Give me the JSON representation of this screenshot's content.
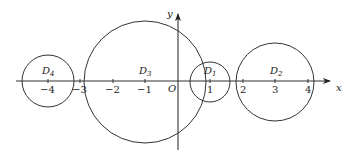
{
  "diagram": {
    "axes": {
      "x_label": "x",
      "y_label": "y",
      "origin_label": "O",
      "x_ticks": [
        {
          "value": -4,
          "label": "−4"
        },
        {
          "value": -3,
          "label": "−3"
        },
        {
          "value": -2,
          "label": "−2"
        },
        {
          "value": -1,
          "label": "−1"
        },
        {
          "value": 1,
          "label": "1"
        },
        {
          "value": 2,
          "label": "2"
        },
        {
          "value": 3,
          "label": "3"
        },
        {
          "value": 4,
          "label": "4"
        }
      ]
    },
    "circles": [
      {
        "name": "D",
        "sub": "1",
        "center_x": 1,
        "radius": 0.6
      },
      {
        "name": "D",
        "sub": "2",
        "center_x": 3,
        "radius": 1.2
      },
      {
        "name": "D",
        "sub": "3",
        "center_x": -1,
        "radius": 1.87
      },
      {
        "name": "D",
        "sub": "4",
        "center_x": -4,
        "radius": 0.8
      }
    ],
    "colors": {
      "line": "#333333",
      "background": "#ffffff"
    }
  }
}
